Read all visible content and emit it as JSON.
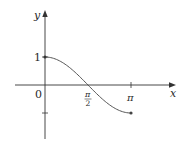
{
  "chart_data": {
    "type": "line",
    "title": "",
    "xlabel": "x",
    "ylabel": "y",
    "function": "cos(x)",
    "domain": [
      0,
      3.14159
    ],
    "x_ticks": [
      {
        "value": 0,
        "label": "0"
      },
      {
        "value": 1.5708,
        "label_num": "π",
        "label_den": "2"
      },
      {
        "value": 3.14159,
        "label": "π"
      }
    ],
    "y_ticks": [
      {
        "value": 1,
        "label": "1"
      },
      {
        "value": -1,
        "label": ""
      }
    ],
    "series": [
      {
        "name": "y = cos x",
        "x": [
          0,
          0.3927,
          0.7854,
          1.1781,
          1.5708,
          1.9635,
          2.3562,
          2.7489,
          3.14159
        ],
        "values": [
          1,
          0.924,
          0.707,
          0.383,
          0,
          -0.383,
          -0.707,
          -0.924,
          -1
        ]
      }
    ],
    "endpoints": [
      [
        0,
        1
      ],
      [
        3.14159,
        -1
      ]
    ],
    "grid": false,
    "legend": null,
    "xlim": [
      -0.7,
      3.2
    ],
    "ylim": [
      -1.5,
      1.4
    ]
  },
  "colors": {
    "axis": "#333333",
    "curve": "#555555",
    "text": "#2a2a2a"
  }
}
